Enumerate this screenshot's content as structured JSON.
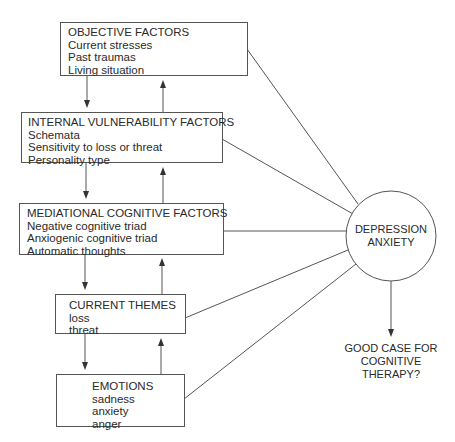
{
  "diagram": {
    "boxes": [
      {
        "id": "objective",
        "title": "OBJECTIVE FACTORS",
        "items": [
          "Current stresses",
          "Past traumas",
          "Living situation"
        ]
      },
      {
        "id": "internal",
        "title": "INTERNAL VULNERABILITY FACTORS",
        "items": [
          "Schemata",
          "Sensitivity to loss or threat",
          "Personality type"
        ]
      },
      {
        "id": "mediational",
        "title": "MEDIATIONAL COGNITIVE FACTORS",
        "items": [
          "Negative cognitive triad",
          "Anxiogenic cognitive triad",
          "Automatic thoughts"
        ]
      },
      {
        "id": "themes",
        "title": "CURRENT THEMES",
        "items": [
          "loss",
          "threat"
        ]
      },
      {
        "id": "emotions",
        "title": "EMOTIONS",
        "items": [
          "sadness",
          "anxiety",
          "anger"
        ]
      }
    ],
    "center": {
      "line1": "DEPRESSION",
      "line2": "ANXIETY"
    },
    "outcome": {
      "line1": "GOOD CASE FOR",
      "line2": "COGNITIVE",
      "line3": "THERAPY?"
    },
    "colors": {
      "line": "#555555",
      "text": "#2a2a2a",
      "background": "#ffffff"
    }
  }
}
